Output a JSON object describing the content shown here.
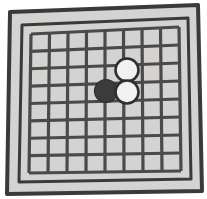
{
  "figure": {
    "title": "Go board diagram",
    "description": "Hand-drawn tilted go board with a 9 by 9 grid, one black stone and two white stones near the center"
  },
  "board": {
    "name": "go-board",
    "grid_columns": 9,
    "grid_rows": 9,
    "colors": {
      "paper": "#ffffff",
      "board_fill": "#d4d3d2",
      "frame_stroke": "#3a3a3a",
      "grid_line": "#4a4a4a",
      "stone_black_fill": "#3b3b3b",
      "stone_white_fill": "#f2f1ef",
      "stone_outline": "#2e2e2e"
    },
    "frame": {
      "outer_points": "10,12 198,5 202,191 7,194",
      "inner_points": "22,25 188,18 191,179 19,182",
      "outer_stroke_width": 4,
      "inner_stroke_width": 3
    },
    "grid": {
      "line_width": 3.2,
      "top_left": [
        31,
        34
      ],
      "top_right": [
        179,
        27
      ],
      "bottom_right": [
        181,
        171
      ],
      "bottom_left": [
        29,
        173
      ]
    }
  },
  "stones": [
    {
      "name": "black-stone",
      "color": "black",
      "cx": 106,
      "cy": 91,
      "r": 11.5,
      "grid_col": 5,
      "grid_row": 5
    },
    {
      "name": "white-stone-upper",
      "color": "white",
      "cx": 127,
      "cy": 70,
      "r": 11.5,
      "grid_col": 6,
      "grid_row": 4
    },
    {
      "name": "white-stone-lower",
      "color": "white",
      "cx": 127,
      "cy": 92,
      "r": 11.5,
      "grid_col": 6,
      "grid_row": 5
    }
  ]
}
